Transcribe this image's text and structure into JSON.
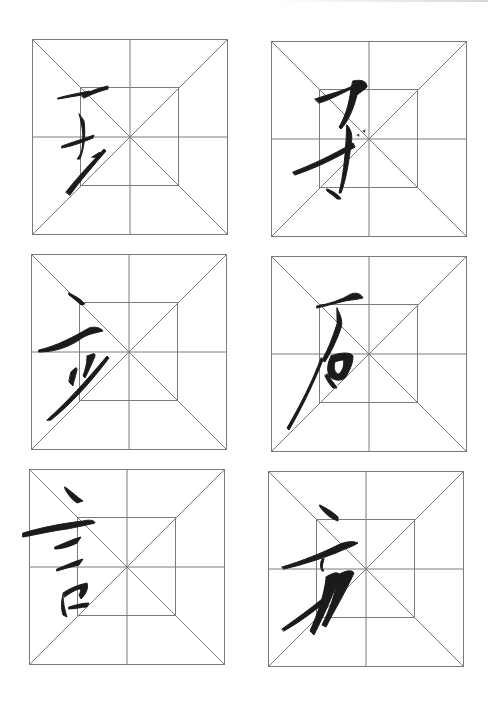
{
  "page": {
    "type": "calligraphy-practice-sheet",
    "grid_style": "mi-zi-ge with inner square",
    "line_color": "#7a7a7a",
    "ink_color": "#1b1b1b",
    "background": "#ffffff"
  },
  "cells": [
    {
      "row": 1,
      "col": 1,
      "character": "去",
      "x": 32,
      "y": 39,
      "size": 196
    },
    {
      "row": 1,
      "col": 2,
      "character": "子",
      "x": 271,
      "y": 41,
      "size": 196
    },
    {
      "row": 2,
      "col": 1,
      "character": "立",
      "x": 31,
      "y": 254,
      "size": 196
    },
    {
      "row": 2,
      "col": 2,
      "character": "石",
      "x": 271,
      "y": 256,
      "size": 196
    },
    {
      "row": 3,
      "col": 1,
      "character": "言",
      "x": 29,
      "y": 469,
      "size": 196
    },
    {
      "row": 3,
      "col": 2,
      "character": "方",
      "x": 268,
      "y": 471,
      "size": 196
    }
  ]
}
